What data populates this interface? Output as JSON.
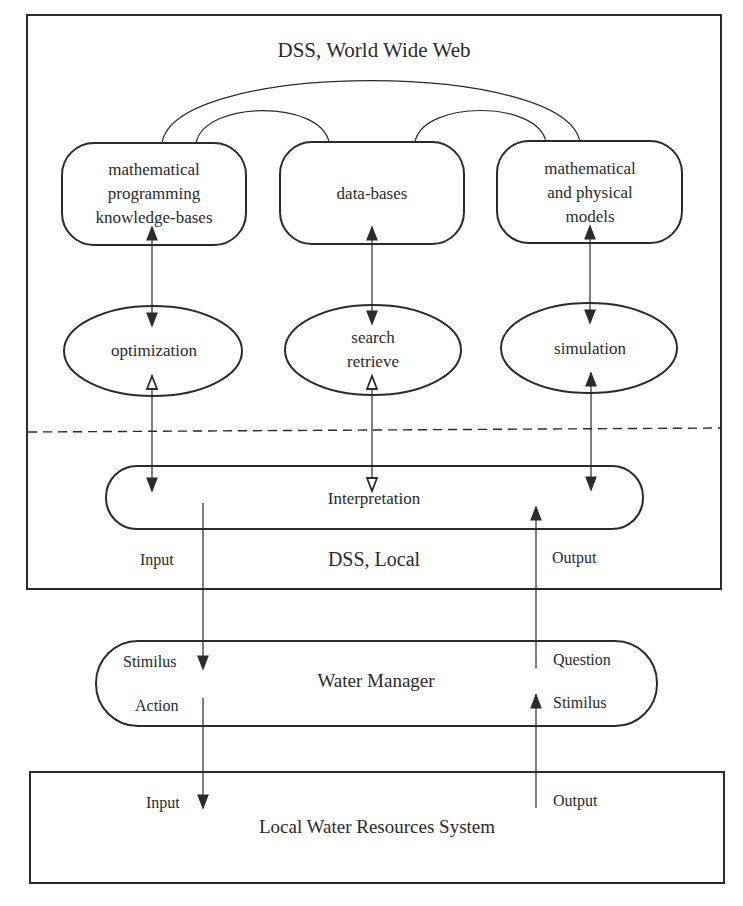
{
  "diagram": {
    "colors": {
      "stroke": "#2b2b2b",
      "text": "#2a2a2a",
      "background": "#ffffff"
    },
    "dss_web": {
      "title": "DSS, World Wide Web",
      "knowledge_boxes": [
        {
          "id": "math-prog",
          "lines": [
            "mathematical",
            "programming",
            "knowledge-bases"
          ]
        },
        {
          "id": "databases",
          "lines": [
            "data-bases"
          ]
        },
        {
          "id": "math-phys",
          "lines": [
            "mathematical",
            "and physical",
            "models"
          ]
        }
      ],
      "process_ellipses": [
        {
          "id": "optimization",
          "lines": [
            "optimization"
          ]
        },
        {
          "id": "search",
          "lines": [
            "search",
            "retrieve"
          ]
        },
        {
          "id": "simulation",
          "lines": [
            "simulation"
          ]
        }
      ]
    },
    "dss_local": {
      "title": "DSS, Local",
      "interpretation_label": "Interpretation",
      "input_label": "Input",
      "output_label": "Output"
    },
    "water_manager": {
      "title": "Water Manager",
      "left_top": "Stimilus",
      "left_bottom": "Action",
      "right_top": "Question",
      "right_bottom": "Stimilus"
    },
    "local_system": {
      "title": "Local Water Resources System",
      "input_label": "Input",
      "output_label": "Output"
    }
  }
}
